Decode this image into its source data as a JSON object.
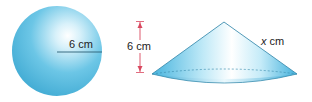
{
  "figure": {
    "sphere": {
      "shape": "sphere",
      "radius_label": "6 cm",
      "fill_color": "#4fb8db",
      "highlight_color": "#ffffff"
    },
    "cone": {
      "shape": "cone",
      "height_label": "6 cm",
      "slant_label_var": "x",
      "slant_label_unit": " cm",
      "fill_color": "#5ec3e3",
      "arrow_color": "#d9485f"
    }
  }
}
